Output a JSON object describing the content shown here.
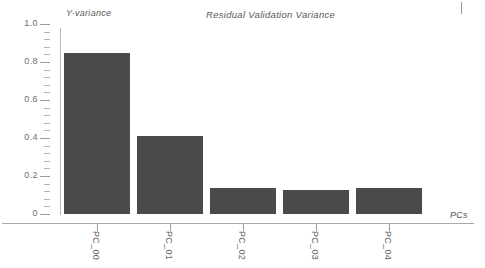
{
  "chart_data": {
    "type": "bar",
    "title": "Residual Validation Variance",
    "xlabel": "PCs",
    "ylabel": "Y-variance",
    "categories": [
      "PC_00",
      "PC_01",
      "PC_02",
      "PC_03",
      "PC_04"
    ],
    "values": [
      0.845,
      0.41,
      0.135,
      0.125,
      0.135
    ],
    "ylim": [
      0,
      1.0
    ],
    "ytick_labels": [
      "0",
      "0.2",
      "0.4",
      "0.6",
      "0.8",
      "1.0"
    ],
    "ytick_values": [
      0,
      0.2,
      0.4,
      0.6,
      0.8,
      1.0
    ],
    "minor_ticks_between": 4,
    "grid": false,
    "legend": "none",
    "series_color": "#4b4b4b",
    "axis_color": "#a9a9a9",
    "text_color": "#55575a"
  }
}
